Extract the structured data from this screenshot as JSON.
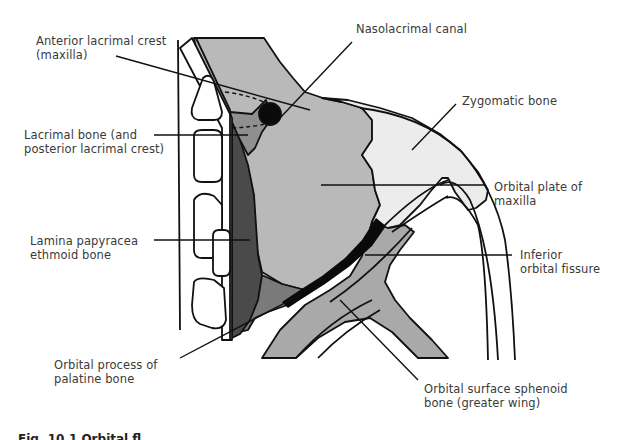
{
  "figure": {
    "caption": "Fig. 10.1 Orbital fl",
    "colors": {
      "background": "#ffffff",
      "outline": "#111111",
      "maxilla": "#b9b9b9",
      "zygomatic": "#ececec",
      "lacrimal": "#8f8f8f",
      "lamina_papyracea": "#4a4a4a",
      "palatine": "#7a7a7a",
      "sphenoid": "#a9a9a9",
      "fissure": "#0a0a0a",
      "label_text": "#3a3a3a"
    }
  },
  "labels": {
    "anterior_lacrimal_crest": [
      "Anterior lacrimal crest",
      "(maxilla)"
    ],
    "nasolacrimal_canal": [
      "Nasolacrimal canal"
    ],
    "zygomatic_bone": [
      "Zygomatic bone"
    ],
    "lacrimal_bone": [
      "Lacrimal bone (and",
      "posterior lacrimal crest)"
    ],
    "orbital_plate_maxilla": [
      "Orbital plate of",
      "maxilla"
    ],
    "lamina_papyracea": [
      "Lamina papyracea",
      "ethmoid bone"
    ],
    "inferior_orbital_fissure": [
      "Inferior",
      "orbital fissure"
    ],
    "orbital_process_palatine": [
      "Orbital process of",
      "palatine bone"
    ],
    "orbital_surface_sphenoid": [
      "Orbital surface sphenoid",
      "bone (greater wing)"
    ]
  }
}
